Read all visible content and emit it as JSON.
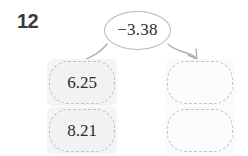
{
  "problem": {
    "number": "12"
  },
  "operation": {
    "label": "−3.38",
    "shape": "oval-icon"
  },
  "diagram": {
    "input_boxes": [
      {
        "value": "6.25",
        "filled": true
      },
      {
        "value": "8.21",
        "filled": true
      }
    ],
    "output_boxes": [
      {
        "value": "",
        "filled": false
      },
      {
        "value": "",
        "filled": false
      }
    ],
    "connectors": [
      {
        "name": "left-input-curve",
        "has_arrowhead": false
      },
      {
        "name": "right-output-arrow",
        "has_arrowhead": true
      }
    ]
  },
  "colors": {
    "text": "#2b2b2b",
    "number_text": "#3a3a3a",
    "oval_stroke": "#b9b9b9",
    "box_border": "#c2c2c2",
    "box_fill": "#f2f2f2",
    "box_fill_empty": "#fcfcfc",
    "connector_stroke": "#b0b0b0",
    "background": "#ffffff"
  }
}
